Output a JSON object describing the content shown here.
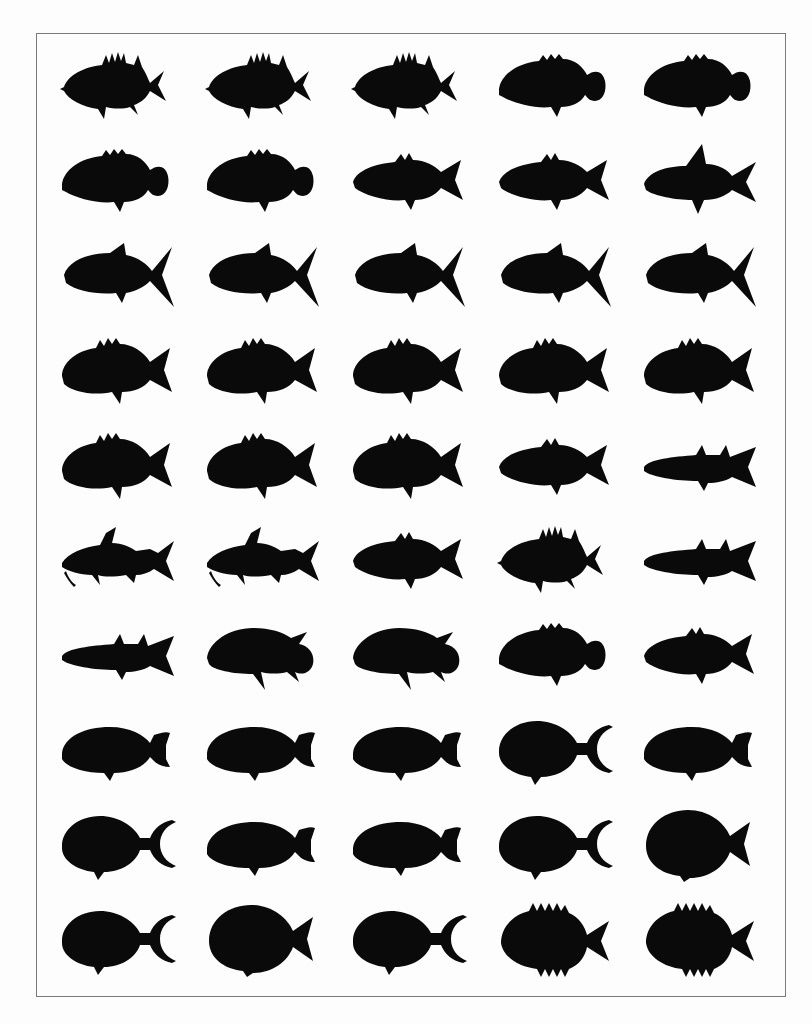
{
  "figure": {
    "rows": 10,
    "columns": 5,
    "silhouette_color": "#0a0a0a",
    "border_color": "#7a7a7a",
    "items": [
      {
        "shape": "spiny-perch",
        "row": 1,
        "col": 1
      },
      {
        "shape": "spiny-perch",
        "row": 1,
        "col": 2
      },
      {
        "shape": "spiny-perch",
        "row": 1,
        "col": 3
      },
      {
        "shape": "round-grouper",
        "row": 1,
        "col": 4
      },
      {
        "shape": "round-grouper",
        "row": 1,
        "col": 5
      },
      {
        "shape": "round-grouper",
        "row": 2,
        "col": 1
      },
      {
        "shape": "round-grouper",
        "row": 2,
        "col": 2
      },
      {
        "shape": "perch",
        "row": 2,
        "col": 3
      },
      {
        "shape": "perch",
        "row": 2,
        "col": 4
      },
      {
        "shape": "tall-fin",
        "row": 2,
        "col": 5
      },
      {
        "shape": "jack",
        "row": 3,
        "col": 1
      },
      {
        "shape": "jack",
        "row": 3,
        "col": 2
      },
      {
        "shape": "jack",
        "row": 3,
        "col": 3
      },
      {
        "shape": "jack",
        "row": 3,
        "col": 4
      },
      {
        "shape": "jack",
        "row": 3,
        "col": 5
      },
      {
        "shape": "snapper",
        "row": 4,
        "col": 1
      },
      {
        "shape": "snapper",
        "row": 4,
        "col": 2
      },
      {
        "shape": "snapper",
        "row": 4,
        "col": 3
      },
      {
        "shape": "snapper",
        "row": 4,
        "col": 4
      },
      {
        "shape": "snapper",
        "row": 4,
        "col": 5
      },
      {
        "shape": "snapper",
        "row": 5,
        "col": 1
      },
      {
        "shape": "snapper",
        "row": 5,
        "col": 2
      },
      {
        "shape": "snapper",
        "row": 5,
        "col": 3
      },
      {
        "shape": "perch",
        "row": 5,
        "col": 4
      },
      {
        "shape": "slender",
        "row": 5,
        "col": 5
      },
      {
        "shape": "catfish",
        "row": 6,
        "col": 1
      },
      {
        "shape": "catfish",
        "row": 6,
        "col": 2
      },
      {
        "shape": "perch",
        "row": 6,
        "col": 3
      },
      {
        "shape": "spiny-perch",
        "row": 6,
        "col": 4
      },
      {
        "shape": "slender",
        "row": 6,
        "col": 5
      },
      {
        "shape": "slender",
        "row": 7,
        "col": 1
      },
      {
        "shape": "cichlid",
        "row": 7,
        "col": 2
      },
      {
        "shape": "cichlid",
        "row": 7,
        "col": 3
      },
      {
        "shape": "round-grouper",
        "row": 7,
        "col": 4
      },
      {
        "shape": "perch",
        "row": 7,
        "col": 5
      },
      {
        "shape": "parrotfish",
        "row": 8,
        "col": 1
      },
      {
        "shape": "parrotfish",
        "row": 8,
        "col": 2
      },
      {
        "shape": "parrotfish",
        "row": 8,
        "col": 3
      },
      {
        "shape": "lunate",
        "row": 8,
        "col": 4
      },
      {
        "shape": "parrotfish",
        "row": 8,
        "col": 5
      },
      {
        "shape": "lunate",
        "row": 9,
        "col": 1
      },
      {
        "shape": "parrotfish",
        "row": 9,
        "col": 2
      },
      {
        "shape": "parrotfish",
        "row": 9,
        "col": 3
      },
      {
        "shape": "lunate",
        "row": 9,
        "col": 4
      },
      {
        "shape": "disc",
        "row": 9,
        "col": 5
      },
      {
        "shape": "lunate",
        "row": 10,
        "col": 1
      },
      {
        "shape": "disc",
        "row": 10,
        "col": 2
      },
      {
        "shape": "lunate",
        "row": 10,
        "col": 3
      },
      {
        "shape": "spiny-disc",
        "row": 10,
        "col": 4
      },
      {
        "shape": "spiny-disc",
        "row": 10,
        "col": 5
      }
    ]
  }
}
